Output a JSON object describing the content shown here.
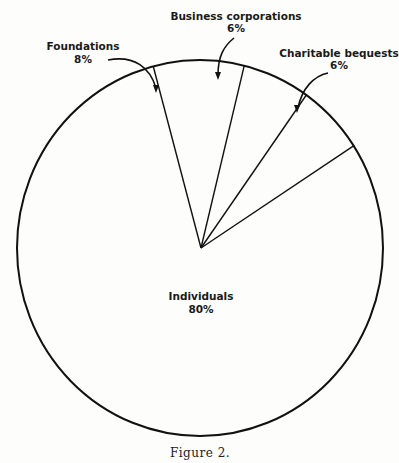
{
  "chart_data": {
    "type": "pie",
    "title": "",
    "caption": "Figure 2.",
    "slices": [
      {
        "label": "Individuals",
        "value": 80,
        "display": "80%"
      },
      {
        "label": "Foundations",
        "value": 8,
        "display": "8%"
      },
      {
        "label": "Business corporations",
        "value": 6,
        "display": "6%"
      },
      {
        "label": "Charitable bequests",
        "value": 6,
        "display": "6%"
      }
    ]
  }
}
